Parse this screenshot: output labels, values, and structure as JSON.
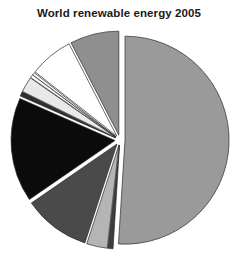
{
  "chart_title": "World renewable energy 2005",
  "chart_data": {
    "type": "pie",
    "title": "World renewable energy 2005",
    "xlabel": "",
    "ylabel": "",
    "legend_position": "none",
    "grid": false,
    "start_angle_deg": 90,
    "direction": "clockwise",
    "exploded": true,
    "categories": [
      "Biomass",
      "Biofuels",
      "Solar hot water",
      "Hydro large",
      "Hydro small",
      "Wind",
      "Geothermal power",
      "Solar PV grid",
      "Solar PV off-grid",
      "Geothermal heat",
      "Tide/wave"
    ],
    "values": [
      51.0,
      0.8,
      3.2,
      10.4,
      16.2,
      0.7,
      2.4,
      0.5,
      0.4,
      6.8,
      7.6
    ],
    "colors": [
      "#9a9a9a",
      "#3d3d3d",
      "#b5b5b5",
      "#4a4a4a",
      "#0b0b0b",
      "#2f2f2f",
      "#e9e9e9",
      "#fbfbfb",
      "#fdfdfd",
      "#ffffff",
      "#8f8f8f"
    ]
  },
  "slices": [
    {
      "name": "Biomass",
      "label": "Biomass",
      "value": 51.0,
      "color": "#9a9a9a"
    },
    {
      "name": "Biofuels",
      "label": "Biofuels",
      "value": 0.8,
      "color": "#3d3d3d"
    },
    {
      "name": "Solar hot water",
      "label": "Solar hot water",
      "value": 3.2,
      "color": "#b5b5b5"
    },
    {
      "name": "Hydro large",
      "label": "Hydro large",
      "value": 10.4,
      "color": "#4a4a4a"
    },
    {
      "name": "Hydro small",
      "label": "Hydro small",
      "value": 16.2,
      "color": "#0b0b0b"
    },
    {
      "name": "Wind",
      "label": "Wind",
      "value": 0.7,
      "color": "#2f2f2f"
    },
    {
      "name": "Geothermal power",
      "label": "Geothermal power",
      "value": 2.4,
      "color": "#e9e9e9"
    },
    {
      "name": "Solar PV grid",
      "label": "Solar PV grid",
      "value": 0.5,
      "color": "#fbfbfb"
    },
    {
      "name": "Solar PV off-grid",
      "label": "Solar PV off-grid",
      "value": 0.4,
      "color": "#fdfdfd"
    },
    {
      "name": "Geothermal heat",
      "label": "Geothermal heat",
      "value": 6.8,
      "color": "#ffffff"
    },
    {
      "name": "Tide/wave",
      "label": "Tide/wave",
      "value": 7.6,
      "color": "#8f8f8f"
    }
  ],
  "geometry": {
    "cx": 120,
    "cy": 116,
    "radius": 104,
    "explode_offset": 5
  }
}
